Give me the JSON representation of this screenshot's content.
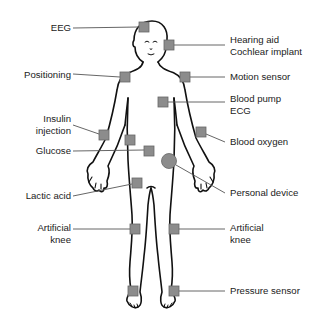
{
  "diagram": {
    "colors": {
      "outline": "#111111",
      "sensor_fill": "#8c8c8c",
      "sensor_stroke": "#666666",
      "leader_line": "#555555",
      "text": "#222222"
    },
    "labels": {
      "eeg": "EEG",
      "hearing_aid": "Hearing aid",
      "cochlear_implant": "Cochlear implant",
      "positioning": "Positioning",
      "motion_sensor": "Motion sensor",
      "blood_pump": "Blood pump",
      "ecg": "ECG",
      "insulin": "Insulin",
      "injection": "injection",
      "glucose": "Glucose",
      "blood_oxygen": "Blood oxygen",
      "personal_device": "Personal device",
      "lactic_acid": "Lactic acid",
      "artificial_left": "Artificial",
      "knee_left": "knee",
      "artificial_right": "Artificial",
      "knee_right": "knee",
      "pressure_sensor": "Pressure sensor"
    },
    "sensors": [
      {
        "name": "EEG",
        "shape": "square",
        "x": 144,
        "y": 27
      },
      {
        "name": "Hearing aid / Cochlear implant",
        "shape": "square",
        "x": 169,
        "y": 45
      },
      {
        "name": "Positioning",
        "shape": "square",
        "x": 125,
        "y": 77
      },
      {
        "name": "Motion sensor",
        "shape": "square",
        "x": 185,
        "y": 77
      },
      {
        "name": "Blood pump / ECG",
        "shape": "square",
        "x": 163,
        "y": 102
      },
      {
        "name": "Insulin injection",
        "shape": "square",
        "x": 104,
        "y": 135
      },
      {
        "name": "Torso sensor",
        "shape": "square",
        "x": 130,
        "y": 140
      },
      {
        "name": "Glucose",
        "shape": "square",
        "x": 149,
        "y": 151
      },
      {
        "name": "Blood oxygen",
        "shape": "square",
        "x": 201,
        "y": 132
      },
      {
        "name": "Personal device",
        "shape": "circle",
        "x": 169,
        "y": 161
      },
      {
        "name": "Lactic acid",
        "shape": "square",
        "x": 137,
        "y": 183
      },
      {
        "name": "Artificial knee (left)",
        "shape": "square",
        "x": 135,
        "y": 229
      },
      {
        "name": "Artificial knee (right)",
        "shape": "square",
        "x": 174,
        "y": 229
      },
      {
        "name": "Foot sensor (left)",
        "shape": "square",
        "x": 133,
        "y": 291
      },
      {
        "name": "Pressure sensor",
        "shape": "square",
        "x": 174,
        "y": 291
      }
    ]
  }
}
